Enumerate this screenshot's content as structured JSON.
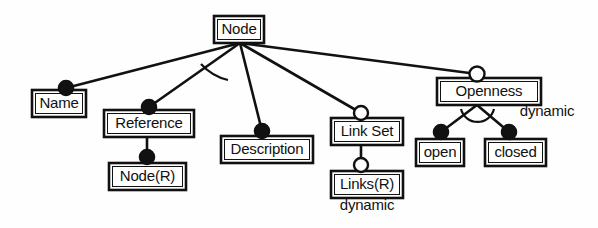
{
  "diagram": {
    "type": "entity-attribute-hierarchy",
    "colors": {
      "background": "#fefefe",
      "stroke": "#111111",
      "fill_filled_marker": "#111111",
      "fill_open_marker": "#ffffff"
    },
    "nodes": [
      {
        "id": "node",
        "label": "Node",
        "x": 214,
        "y": 16,
        "w": 50,
        "h": 27
      },
      {
        "id": "name",
        "label": "Name",
        "x": 32,
        "y": 90,
        "w": 54,
        "h": 27
      },
      {
        "id": "reference",
        "label": "Reference",
        "x": 104,
        "y": 110,
        "w": 90,
        "h": 27
      },
      {
        "id": "node_r",
        "label": "Node(R)",
        "x": 109,
        "y": 163,
        "w": 77,
        "h": 27
      },
      {
        "id": "description",
        "label": "Description",
        "x": 221,
        "y": 136,
        "w": 92,
        "h": 27
      },
      {
        "id": "link_set",
        "label": "Link Set",
        "x": 331,
        "y": 118,
        "w": 72,
        "h": 27
      },
      {
        "id": "links_r",
        "label": "Links(R)",
        "x": 331,
        "y": 171,
        "w": 72,
        "h": 27
      },
      {
        "id": "openness",
        "label": "Openness",
        "x": 437,
        "y": 78,
        "w": 104,
        "h": 27
      },
      {
        "id": "open",
        "label": "open",
        "x": 416,
        "y": 139,
        "w": 48,
        "h": 27
      },
      {
        "id": "closed",
        "label": "closed",
        "x": 485,
        "y": 139,
        "w": 61,
        "h": 27
      }
    ],
    "annotations": [
      {
        "id": "dynamic-openness",
        "label": "dynamic",
        "x": 547,
        "y": 112
      },
      {
        "id": "dynamic-links",
        "label": "dynamic",
        "x": 367,
        "y": 206
      }
    ],
    "markers": [
      {
        "id": "marker-name",
        "kind": "filled",
        "x": 66,
        "y": 88,
        "r": 7.5
      },
      {
        "id": "marker-reference",
        "kind": "filled",
        "x": 149,
        "y": 107,
        "r": 7.5
      },
      {
        "id": "marker-node-r",
        "kind": "filled",
        "x": 147,
        "y": 157,
        "r": 7.5
      },
      {
        "id": "marker-description",
        "kind": "filled",
        "x": 262,
        "y": 131,
        "r": 7.5
      },
      {
        "id": "marker-link-set",
        "kind": "open",
        "x": 361,
        "y": 113,
        "r": 7.0
      },
      {
        "id": "marker-links-r",
        "kind": "open",
        "x": 361,
        "y": 165,
        "r": 7.0
      },
      {
        "id": "marker-openness",
        "kind": "open",
        "x": 477,
        "y": 74,
        "r": 7.5
      },
      {
        "id": "marker-open",
        "kind": "filled",
        "x": 441,
        "y": 132,
        "r": 7.5
      },
      {
        "id": "marker-closed",
        "kind": "filled",
        "x": 509,
        "y": 132,
        "r": 7.5
      }
    ],
    "edges": [
      {
        "id": "edge-node-name",
        "from": "node",
        "to": "name",
        "x1": 240,
        "y1": 43,
        "x2": 66,
        "y2": 88
      },
      {
        "id": "edge-node-reference",
        "from": "node",
        "to": "reference",
        "x1": 240,
        "y1": 43,
        "x2": 149,
        "y2": 107
      },
      {
        "id": "edge-node-description",
        "from": "node",
        "to": "description",
        "x1": 240,
        "y1": 43,
        "x2": 262,
        "y2": 131
      },
      {
        "id": "edge-node-linkset",
        "from": "node",
        "to": "link_set",
        "x1": 240,
        "y1": 43,
        "x2": 361,
        "y2": 113
      },
      {
        "id": "edge-node-openness",
        "from": "node",
        "to": "openness",
        "x1": 240,
        "y1": 43,
        "x2": 477,
        "y2": 74
      },
      {
        "id": "edge-reference-nodeR",
        "from": "reference",
        "to": "node_r",
        "x1": 147,
        "y1": 137,
        "x2": 147,
        "y2": 157
      },
      {
        "id": "edge-linkset-linksR",
        "from": "link_set",
        "to": "links_r",
        "x1": 361,
        "y1": 145,
        "x2": 361,
        "y2": 165
      },
      {
        "id": "edge-openness-open",
        "from": "openness",
        "to": "open",
        "x1": 477,
        "y1": 105,
        "x2": 441,
        "y2": 132
      },
      {
        "id": "edge-openness-closed",
        "from": "openness",
        "to": "closed",
        "x1": 477,
        "y1": 105,
        "x2": 509,
        "y2": 132
      }
    ],
    "arcs": [
      {
        "id": "arc-node-generalization",
        "d": "M 203 66 A 50 50 0 0 0 226 78"
      },
      {
        "id": "arc-openness-generalization",
        "d": "M 461 110 A 17 17 0 0 0 494 110"
      }
    ]
  }
}
